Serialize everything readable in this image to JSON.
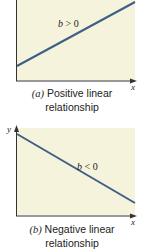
{
  "colors": {
    "plot_background": "#f6f3dc",
    "line": "#3d5f86",
    "axis": "#333333",
    "text": "#222222"
  },
  "panels": [
    {
      "id": "a",
      "letter": "(a)",
      "caption_line1": "Positive linear",
      "caption_line2": "relationship",
      "slope_label": "b > 0",
      "x_label": "x",
      "y_label": "y"
    },
    {
      "id": "b",
      "letter": "(b)",
      "caption_line1": "Negative linear",
      "caption_line2": "relationship",
      "slope_label": "b < 0",
      "x_label": "x",
      "y_label": "y"
    }
  ]
}
